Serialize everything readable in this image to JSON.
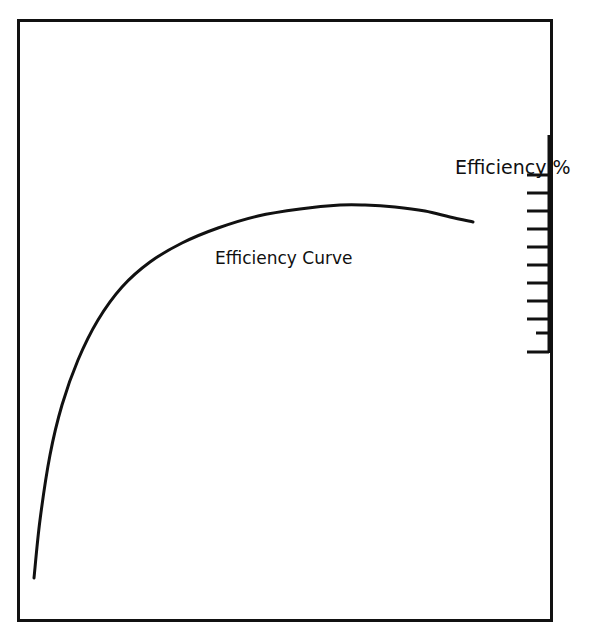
{
  "figure": {
    "background_color": "#ffffff",
    "ink_color": "#111111",
    "frame": {
      "name": "plot-border",
      "x": 17,
      "y": 19,
      "width": 536,
      "height": 603,
      "stroke_width": 3
    }
  },
  "labels": {
    "axis_label": "Efficiency %",
    "curve_label": "Efficiency Curve"
  },
  "axis": {
    "name": "efficiency-axis",
    "orientation": "vertical",
    "position_x": 549,
    "y_top": 135,
    "y_bottom": 353,
    "tick_count": 11,
    "tick_length": 22,
    "short_tick_length": 13,
    "short_tick_index": 9,
    "tick_spacing": 18,
    "first_tick_y": 175,
    "stroke_width": 3
  },
  "chart_data": {
    "type": "line",
    "title": "",
    "subtitle": "",
    "xlabel": "",
    "ylabel": "Efficiency %",
    "grid": false,
    "legend_position": "inline-annotation",
    "series": [
      {
        "name": "Efficiency Curve",
        "points": [
          [
            34,
            578
          ],
          [
            40,
            520
          ],
          [
            50,
            455
          ],
          [
            62,
            405
          ],
          [
            78,
            360
          ],
          [
            98,
            320
          ],
          [
            122,
            287
          ],
          [
            150,
            262
          ],
          [
            182,
            243
          ],
          [
            218,
            228
          ],
          [
            258,
            216
          ],
          [
            300,
            209
          ],
          [
            340,
            205
          ],
          [
            365,
            205
          ],
          [
            395,
            207
          ],
          [
            425,
            211
          ],
          [
            450,
            217
          ],
          [
            473,
            222
          ]
        ],
        "stroke_width": 3,
        "color": "#111111",
        "peak": [
          365,
          205
        ],
        "start": [
          34,
          578
        ],
        "end": [
          473,
          222
        ]
      }
    ],
    "annotations": [
      {
        "text": "Efficiency Curve",
        "x": 215,
        "y": 264,
        "anchor": "start"
      },
      {
        "text": "Efficiency %",
        "x": 455,
        "y": 174,
        "anchor": "start"
      }
    ],
    "axis_ticks": {
      "values": [],
      "tick_ys": [
        175,
        193,
        211,
        229,
        247,
        265,
        283,
        301,
        319,
        333,
        352
      ]
    }
  }
}
